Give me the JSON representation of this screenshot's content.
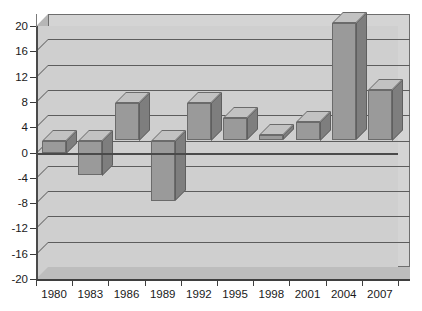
{
  "chart_data": {
    "type": "bar",
    "title": "",
    "xlabel": "",
    "ylabel": "",
    "categories": [
      "1980",
      "1983",
      "1986",
      "1989",
      "1992",
      "1995",
      "1998",
      "2001",
      "2004",
      "2007"
    ],
    "values": [
      -2,
      -5.5,
      6,
      -9.5,
      6,
      3.5,
      0.8,
      3,
      18.5,
      8
    ],
    "ylim": [
      -20,
      20
    ],
    "yticks": [
      20,
      16,
      12,
      8,
      4,
      0,
      -4,
      -8,
      -12,
      -16,
      -20
    ],
    "ytick_labels": [
      "20",
      "16",
      "12",
      "8",
      "4",
      "0",
      "-4",
      "-8",
      "-12",
      "-16",
      "-20"
    ],
    "xtick_labels": [
      "1980",
      "1983",
      "1986",
      "1989",
      "1992",
      "1995",
      "1998",
      "2001",
      "2004",
      "2007"
    ],
    "grid": true,
    "legend": false,
    "style": "3d-bar",
    "colors": {
      "bar_face": "#9a9a9a",
      "bar_side": "#7e7e7e",
      "bar_top": "#c2c2c2",
      "plot_background": "#d4d4d4",
      "grid_line": "#5d5d5d",
      "axis": "#3f3f3f",
      "text": "#1a1a1a",
      "page_background": "#ffffff"
    }
  }
}
